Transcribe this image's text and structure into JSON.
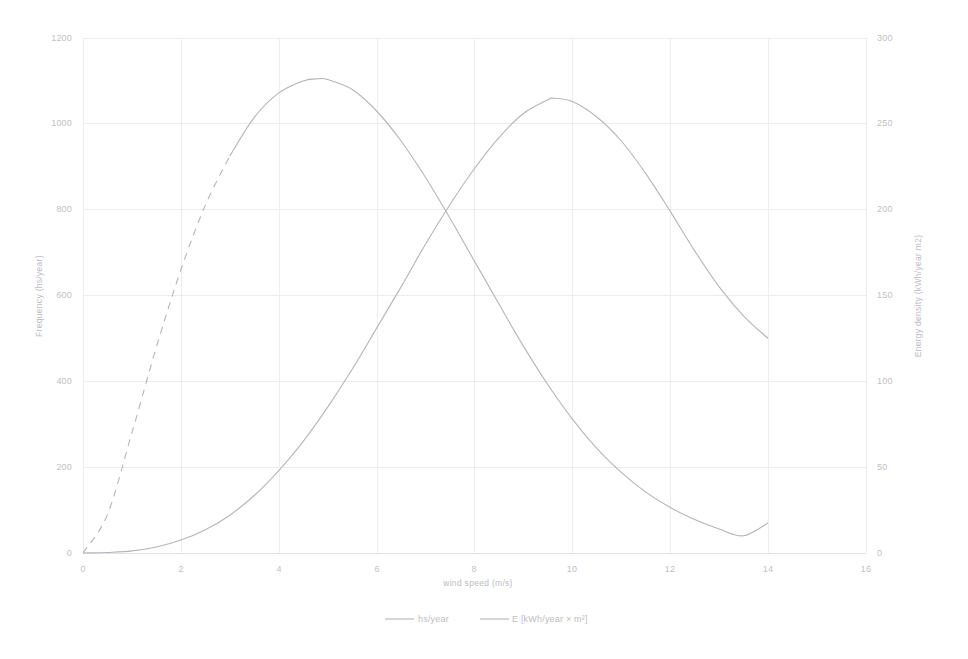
{
  "chart_data": {
    "type": "line",
    "title": "",
    "subtitle": "",
    "xlabel": "wind speed (m/s)",
    "ylabel": "Frequency (hs/year)",
    "y2label": "Energy density (kWh/year m2)",
    "xlim": [
      0,
      16
    ],
    "ylim": [
      0,
      1200
    ],
    "y2lim": [
      0,
      300
    ],
    "xticks": [
      0,
      2,
      4,
      6,
      8,
      10,
      12,
      14,
      16
    ],
    "xticklabels": [
      "0",
      "2",
      "4",
      "6",
      "8",
      "10",
      "12",
      "14",
      "16"
    ],
    "yticks": [
      0,
      200,
      400,
      600,
      800,
      1000,
      1200
    ],
    "yticklabels": [
      "0",
      "200",
      "400",
      "600",
      "800",
      "1000",
      "1200"
    ],
    "y2ticks": [
      0,
      50,
      100,
      150,
      200,
      250,
      300
    ],
    "y2ticklabels": [
      "0",
      "50",
      "100",
      "150",
      "200",
      "250",
      "300"
    ],
    "grid": true,
    "legend_position": "bottom",
    "legend": [
      "hs/year",
      "E [kWh/year × m²]"
    ],
    "series": [
      {
        "name": "hs/year",
        "axis": "left",
        "style": "solid-with-dashed-rising-flank",
        "dashed_until_x": 2.9,
        "color": "#b5b5ba",
        "x": [
          0,
          0.5,
          1.0,
          1.5,
          2.0,
          2.5,
          3.0,
          3.5,
          4.0,
          4.5,
          4.8,
          5.0,
          5.5,
          6.0,
          6.5,
          7.0,
          7.5,
          8.0,
          8.5,
          9.0,
          9.5,
          10.0,
          10.5,
          11.0,
          11.5,
          12.0,
          12.5,
          13.0,
          13.5,
          14.0
        ],
        "y": [
          0,
          90,
          280,
          480,
          660,
          810,
          925,
          1015,
          1072,
          1100,
          1105,
          1103,
          1080,
          1030,
          960,
          875,
          780,
          680,
          580,
          482,
          392,
          312,
          244,
          188,
          142,
          106,
          78,
          56,
          40,
          70
        ]
      },
      {
        "name": "E [kWh/year × m²]",
        "axis": "right",
        "style": "solid",
        "color": "#b5b5ba",
        "x": [
          0,
          0.5,
          1.0,
          1.5,
          2.0,
          2.5,
          3.0,
          3.5,
          4.0,
          4.5,
          5.0,
          5.5,
          6.0,
          6.5,
          7.0,
          7.5,
          8.0,
          8.5,
          9.0,
          9.5,
          9.6,
          10.0,
          10.5,
          11.0,
          11.5,
          12.0,
          12.5,
          13.0,
          13.5,
          14.0
        ],
        "y": [
          0,
          0.3,
          1.2,
          3.5,
          7.5,
          13.5,
          22,
          33.5,
          48,
          65,
          85,
          107,
          131,
          155,
          180,
          203,
          224,
          242,
          256,
          264,
          265,
          263,
          254,
          240,
          221,
          199,
          176,
          155,
          138,
          125
        ]
      }
    ],
    "peaks": {
      "frequency_peak": {
        "x": 4.8,
        "y": 1105
      },
      "energy_peak": {
        "x": 9.6,
        "y": 265
      }
    },
    "crossing_point": {
      "x": 7.45,
      "frequency": 790,
      "energy": 201
    }
  },
  "axes": {
    "left_title": "Frequency (hs/year)",
    "right_title": "Energy density (kWh/year m2)",
    "bottom_title": "wind speed (m/s)"
  },
  "legend": {
    "items": [
      {
        "label": "hs/year"
      },
      {
        "label": "E [kWh/year × m²]"
      }
    ]
  },
  "caption": {
    "text": ""
  },
  "colors": {
    "series": "#b5b5ba",
    "grid": "#ededf0",
    "axis": "#e2e2e6",
    "text": "#bfbfc2",
    "background": "#ffffff"
  }
}
